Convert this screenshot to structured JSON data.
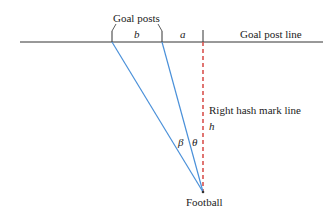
{
  "diagram": {
    "labels": {
      "goal_posts": "Goal posts",
      "goal_post_line": "Goal post line",
      "right_hash_mark_line": "Right hash mark line",
      "football": "Football",
      "b": "b",
      "a": "a",
      "h": "h",
      "beta": "β",
      "theta": "θ"
    },
    "colors": {
      "sight_lines": "#4a90d9",
      "hash_line": "#d9534f",
      "goal_line": "#333333"
    }
  }
}
